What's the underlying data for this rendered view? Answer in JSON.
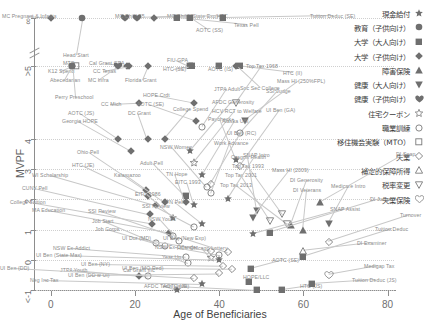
{
  "chart_data": {
    "type": "scatter",
    "title": "",
    "xlabel": "Age of Beneficiaries",
    "ylabel": "MVPF",
    "xlim": [
      -4,
      82
    ],
    "ylim": [
      -1,
      8
    ],
    "xticks": [
      "0",
      "20",
      "40",
      "60",
      "80"
    ],
    "xtickvals": [
      0,
      20,
      40,
      60,
      80
    ],
    "yticks": [
      "∞",
      ">5",
      "4",
      "3",
      "2",
      "1",
      "0",
      "<-1"
    ],
    "ytickvals": [
      8,
      6.4,
      4,
      3,
      2,
      1,
      0,
      -1
    ],
    "grid": "horizontal-dotted",
    "legend_position": "top-right-outside",
    "axis_break": true,
    "series": [
      {
        "name": "現金給付",
        "marker": "star",
        "color": "#6a6a6a"
      },
      {
        "name": "教育（子供向け）",
        "marker": "circle-filled",
        "color": "#6a6a6a"
      },
      {
        "name": "大学（大人向け）",
        "marker": "square-filled",
        "color": "#6a6a6a"
      },
      {
        "name": "大学（子供向け）",
        "marker": "diamond-filled",
        "color": "#6a6a6a"
      },
      {
        "name": "障害保険",
        "marker": "triangle-up-filled",
        "color": "#6a6a6a"
      },
      {
        "name": "健康（大人向け）",
        "marker": "triangle-down-filled",
        "color": "#6a6a6a"
      },
      {
        "name": "健康（子供向け）",
        "marker": "heart-filled",
        "color": "#6a6a6a"
      },
      {
        "name": "住宅クーポン",
        "marker": "star-open",
        "color": "#6a6a6a"
      },
      {
        "name": "職業訓練",
        "marker": "circle-open",
        "color": "#6a6a6a"
      },
      {
        "name": "移住機会実験（MTO）",
        "marker": "square-open",
        "color": "#6a6a6a"
      },
      {
        "name": "失業",
        "marker": "diamond-open",
        "color": "#6a6a6a"
      },
      {
        "name": "補定的保障所得",
        "marker": "triangle-up-open",
        "color": "#6a6a6a"
      },
      {
        "name": "税率変更",
        "marker": "triangle-down-open",
        "color": "#6a6a6a"
      },
      {
        "name": "失業保険",
        "marker": "heart-open",
        "color": "#6a6a6a"
      }
    ],
    "points": [
      {
        "label": "MC Pregnant & Infants",
        "x": 0.0,
        "y": 8.0,
        "marker": "diamond-filled",
        "lx": 2,
        "ly": 13
      },
      {
        "label": "Head Start",
        "x": 7.5,
        "y": 8.0,
        "marker": "circle-filled",
        "lx": 63,
        "ly": 52
      },
      {
        "label": "MC Child 85",
        "x": 17.5,
        "y": 8.0,
        "marker": "heart-filled",
        "lx": 115,
        "ly": 13
      },
      {
        "label": "MC Child (State Exp)",
        "x": 20.5,
        "y": 8.0,
        "marker": "heart-filled",
        "lx": 167,
        "ly": 13
      },
      {
        "label": "HTC",
        "x": 24.5,
        "y": 8.0,
        "marker": "diamond-filled",
        "lx": 217,
        "ly": 13
      },
      {
        "label": "Texas Pell",
        "x": 30.0,
        "y": 8.0,
        "marker": "square-filled",
        "lx": 234,
        "ly": 22
      },
      {
        "label": "AOTC (SS)",
        "x": 33.0,
        "y": 8.0,
        "marker": "square-filled",
        "lx": 196,
        "ly": 27
      },
      {
        "label": "Tuition Deduc (SE)",
        "x": 41.0,
        "y": 8.0,
        "marker": "square-filled",
        "lx": 310,
        "ly": 13
      },
      {
        "label": "MTO",
        "x": 6.0,
        "y": 6.4,
        "marker": "square-open",
        "lx": 63,
        "ly": 60
      },
      {
        "label": "K12 Spend",
        "x": 5.0,
        "y": 6.4,
        "marker": "circle-filled",
        "lx": 48,
        "ly": 68
      },
      {
        "label": "Abecedarian",
        "x": 5.0,
        "y": 6.4,
        "marker": "circle-filled",
        "lx": 50,
        "ly": 77
      },
      {
        "label": "Perry Preschool",
        "x": 5.0,
        "y": 6.4,
        "marker": "circle-filled",
        "lx": 55,
        "ly": 94
      },
      {
        "label": "Cal Grant GPA",
        "x": 18.0,
        "y": 6.4,
        "marker": "diamond-filled",
        "lx": 89,
        "ly": 60
      },
      {
        "label": "CC Texas",
        "x": 18.5,
        "y": 6.4,
        "marker": "diamond-filled",
        "lx": 93,
        "ly": 68
      },
      {
        "label": "MC Infra",
        "x": 16.0,
        "y": 6.4,
        "marker": "heart-filled",
        "lx": 88,
        "ly": 77
      },
      {
        "label": "Florida Grant",
        "x": 23.0,
        "y": 6.4,
        "marker": "diamond-filled",
        "lx": 125,
        "ly": 77
      },
      {
        "label": "FIU GPA",
        "x": 33.0,
        "y": 6.4,
        "marker": "square-filled",
        "lx": 167,
        "ly": 57
      },
      {
        "label": "HTC (SE)",
        "x": 33.5,
        "y": 6.4,
        "marker": "square-filled",
        "lx": 163,
        "ly": 66
      },
      {
        "label": "AOTC (IS)",
        "x": 40.0,
        "y": 6.4,
        "marker": "square-filled",
        "lx": 208,
        "ly": 66
      },
      {
        "label": "HTC (II)",
        "x": 45.0,
        "y": 6.4,
        "marker": "square-filled",
        "lx": 283,
        "ly": 70
      },
      {
        "label": "Soc Sec College",
        "x": 44.0,
        "y": 6.4,
        "marker": "diamond-filled",
        "lx": 240,
        "ly": 85
      },
      {
        "label": "CC Mich",
        "x": 21.0,
        "y": 5.2,
        "marker": "diamond-filled",
        "lx": 101,
        "ly": 101
      },
      {
        "label": "AOTC (JS)",
        "x": 16.0,
        "y": 4.0,
        "marker": "diamond-filled",
        "lx": 68,
        "ly": 110
      },
      {
        "label": "DC Grant",
        "x": 23.0,
        "y": 4.0,
        "marker": "diamond-filled",
        "lx": 128,
        "ly": 110
      },
      {
        "label": "HOPE Crdt",
        "x": 34.0,
        "y": 5.2,
        "marker": "diamond-filled",
        "lx": 143,
        "ly": 92
      },
      {
        "label": "AOTC (SE)",
        "x": 34.5,
        "y": 4.6,
        "marker": "diamond-filled",
        "lx": 137,
        "ly": 101
      },
      {
        "label": "College Spend",
        "x": 27.0,
        "y": 4.0,
        "marker": "diamond-filled",
        "lx": 173,
        "ly": 106
      },
      {
        "label": "Georgia HOPE",
        "x": 19.0,
        "y": 3.6,
        "marker": "diamond-filled",
        "lx": 62,
        "ly": 118
      },
      {
        "label": "Paycheck+",
        "x": 44.0,
        "y": 3.3,
        "marker": "star",
        "lx": 208,
        "ly": 116
      },
      {
        "label": "Ohio Pell",
        "x": 22.5,
        "y": 2.3,
        "marker": "diamond-filled",
        "lx": 77,
        "ly": 149
      },
      {
        "label": "HTC (JE)",
        "x": 23.0,
        "y": 2.1,
        "marker": "diamond-filled",
        "lx": 72,
        "ly": 162
      },
      {
        "label": "Adult Pell",
        "x": 32.0,
        "y": 2.1,
        "marker": "square-filled",
        "lx": 140,
        "ly": 160
      },
      {
        "label": "NSW Women",
        "x": 37.0,
        "y": 2.4,
        "marker": "circle-open",
        "lx": 160,
        "ly": 144
      },
      {
        "label": "Kalamazoo",
        "x": 27.0,
        "y": 1.9,
        "marker": "diamond-filled",
        "lx": 114,
        "ly": 172
      },
      {
        "label": "WI Scholarship",
        "x": 25.0,
        "y": 1.8,
        "marker": "diamond-filled",
        "lx": 32,
        "ly": 172
      },
      {
        "label": "TN Hope",
        "x": 32.0,
        "y": 1.9,
        "marker": "diamond-filled",
        "lx": 166,
        "ly": 171
      },
      {
        "label": "EITC 1993",
        "x": 34.0,
        "y": 1.8,
        "marker": "star",
        "lx": 175,
        "ly": 179
      },
      {
        "label": "CUNY Pell",
        "x": 23.5,
        "y": 1.5,
        "marker": "diamond-filled",
        "lx": 22,
        "ly": 185
      },
      {
        "label": "EITC 1986",
        "x": 29.0,
        "y": 1.4,
        "marker": "star",
        "lx": 135,
        "ly": 191
      },
      {
        "label": "College Tuition",
        "x": 24.0,
        "y": 1.2,
        "marker": "diamond-filled",
        "lx": 10,
        "ly": 199
      },
      {
        "label": "SSI Review",
        "x": 34.0,
        "y": 1.1,
        "marker": "circle-open",
        "lx": 142,
        "ly": 203
      },
      {
        "label": "TN Pell",
        "x": 36.0,
        "y": 1.2,
        "marker": "star",
        "lx": 166,
        "ly": 199
      },
      {
        "label": "MA Education",
        "x": 28.0,
        "y": 0.9,
        "marker": "diamond-filled",
        "lx": 32,
        "ly": 207
      },
      {
        "label": "SSI Review",
        "x": 29.0,
        "y": 0.8,
        "marker": "circle-open",
        "lx": 88,
        "ly": 208
      },
      {
        "label": "Oregon Health",
        "x": 49.0,
        "y": 1.6,
        "marker": "triangle-down-filled",
        "lx": 231,
        "ly": 154
      },
      {
        "label": "Top Tax 1993",
        "x": 55.0,
        "y": 1.5,
        "marker": "triangle-down-open",
        "lx": 232,
        "ly": 163
      },
      {
        "label": "Mass HI (2009)",
        "x": 48.0,
        "y": 1.4,
        "marker": "triangle-down-filled",
        "lx": 272,
        "ly": 167
      },
      {
        "label": "Top Tax 2001",
        "x": 52.0,
        "y": 1.3,
        "marker": "triangle-down-open",
        "lx": 225,
        "ly": 172
      },
      {
        "label": "Top Tax 2013",
        "x": 56.0,
        "y": 1.2,
        "marker": "triangle-down-open",
        "lx": 220,
        "ly": 182
      },
      {
        "label": "DI Generosity",
        "x": 57.0,
        "y": 1.15,
        "marker": "triangle-up-filled",
        "lx": 290,
        "ly": 177
      },
      {
        "label": "DI Veterans",
        "x": 60.0,
        "y": 1.0,
        "marker": "triangle-up-filled",
        "lx": 293,
        "ly": 187
      },
      {
        "label": "Medicare Intro",
        "x": 66.0,
        "y": 1.2,
        "marker": "triangle-down-filled",
        "lx": 331,
        "ly": 183
      },
      {
        "label": "Top Tax 1968",
        "x": 44.0,
        "y": 5.2,
        "marker": "triangle-down-open",
        "lx": 246,
        "ly": 63
      },
      {
        "label": "JTPA Adult",
        "x": 36.0,
        "y": 4.4,
        "marker": "circle-open",
        "lx": 214,
        "ly": 86
      },
      {
        "label": "SSI Judge",
        "x": 45.0,
        "y": 4.2,
        "marker": "circle-open",
        "lx": 266,
        "ly": 88
      },
      {
        "label": "Mass HI (250%FPL)",
        "x": 46.0,
        "y": 4.6,
        "marker": "triangle-down-filled",
        "lx": 277,
        "ly": 78
      },
      {
        "label": "AFDC Generosity",
        "x": 33.0,
        "y": 3.6,
        "marker": "star",
        "lx": 212,
        "ly": 99
      },
      {
        "label": "HCV RCT to Welfare",
        "x": 34.0,
        "y": 3.2,
        "marker": "star-open",
        "lx": 212,
        "ly": 108
      },
      {
        "label": "UI Ben (GA)",
        "x": 45.0,
        "y": 3.1,
        "marker": "diamond-open",
        "lx": 266,
        "ly": 107
      },
      {
        "label": "Alaska UBI",
        "x": 36.0,
        "y": 2.8,
        "marker": "star",
        "lx": 222,
        "ly": 118
      },
      {
        "label": "UI Ben (RC)",
        "x": 38.0,
        "y": 2.5,
        "marker": "diamond-open",
        "lx": 227,
        "ly": 130
      },
      {
        "label": "Work Advance",
        "x": 38.0,
        "y": 2.2,
        "marker": "circle-open",
        "lx": 214,
        "ly": 140
      },
      {
        "label": "SNAP Intro",
        "x": 42.0,
        "y": 2.0,
        "marker": "star",
        "lx": 243,
        "ly": 152
      },
      {
        "label": "Job Start",
        "x": 25.0,
        "y": 0.55,
        "marker": "circle-open",
        "lx": 92,
        "ly": 218
      },
      {
        "label": "NSW Youth",
        "x": 30.5,
        "y": 0.62,
        "marker": "circle-open",
        "lx": 148,
        "ly": 216
      },
      {
        "label": "Job Corps",
        "x": 27.0,
        "y": 0.45,
        "marker": "circle-open",
        "lx": 95,
        "ly": 226
      },
      {
        "label": "NSW Ex-Addict",
        "x": 32.0,
        "y": 0.1,
        "marker": "circle-open",
        "lx": 53,
        "ly": 245
      },
      {
        "label": "Year Up",
        "x": 32.5,
        "y": -0.1,
        "marker": "circle-open",
        "lx": 162,
        "ly": 254
      },
      {
        "label": "HCV Chicago Lottery",
        "x": 38.0,
        "y": 0.05,
        "marker": "star-open",
        "lx": 177,
        "ly": 245
      },
      {
        "label": "JTPA Youth",
        "x": 23.0,
        "y": -0.55,
        "marker": "circle-open",
        "lx": 60,
        "ly": 267
      },
      {
        "label": "Cal Grant Inc",
        "x": 21.0,
        "y": -0.55,
        "marker": "diamond-filled",
        "lx": 123,
        "ly": 267
      },
      {
        "label": "AFDC Term Limits",
        "x": 30.0,
        "y": -1.0,
        "marker": "star",
        "lx": 144,
        "ly": 283
      },
      {
        "label": "UI Dur (MD)",
        "x": 38.0,
        "y": 0.3,
        "marker": "diamond-open",
        "lx": 122,
        "ly": 235
      },
      {
        "label": "UI Ben (New Exp)",
        "x": 42.0,
        "y": 0.25,
        "marker": "diamond-open",
        "lx": 163,
        "ly": 235
      },
      {
        "label": "NSW Ex-Offender",
        "x": 40.0,
        "y": 0.15,
        "marker": "circle-open",
        "lx": 155,
        "ly": 244
      },
      {
        "label": "UI Ben (State Max)",
        "x": 40.0,
        "y": 0.0,
        "marker": "star",
        "lx": 36,
        "ly": 252
      },
      {
        "label": "UI Ben (NY)",
        "x": 41.0,
        "y": -0.2,
        "marker": "diamond-open",
        "lx": 81,
        "ly": 261
      },
      {
        "label": "UI Ben (MO Red)",
        "x": 43.0,
        "y": -0.3,
        "marker": "diamond-open",
        "lx": 122,
        "ly": 265
      },
      {
        "label": "UI Ben (DD w UI)",
        "x": 40.0,
        "y": -0.45,
        "marker": "diamond-open",
        "lx": 68,
        "ly": 272
      },
      {
        "label": "UI Ben (DD)",
        "x": 34.0,
        "y": -0.6,
        "marker": "diamond-open",
        "lx": 0,
        "ly": 265
      },
      {
        "label": "Neg Inc Tax",
        "x": 36.0,
        "y": -0.8,
        "marker": "star",
        "lx": 30,
        "ly": 277
      },
      {
        "label": "AOTC (JE)",
        "x": 49.0,
        "y": -1.0,
        "marker": "square-filled",
        "lx": 163,
        "ly": 283
      },
      {
        "label": "HTC (JS)",
        "x": 55.0,
        "y": -1.0,
        "marker": "square-filled",
        "lx": 300,
        "ly": 283
      },
      {
        "label": "HOPE/LLC",
        "x": 47.0,
        "y": -0.75,
        "marker": "square-filled",
        "lx": 243,
        "ly": 274
      },
      {
        "label": "AOTC (SE)",
        "x": 47.5,
        "y": -0.3,
        "marker": "square-filled",
        "lx": 272,
        "ly": 257
      },
      {
        "label": "DI Judge",
        "x": 52.0,
        "y": 0.9,
        "marker": "square-filled",
        "lx": 370,
        "ly": 196
      },
      {
        "label": "DI Examiner",
        "x": 60.0,
        "y": 0.3,
        "marker": "triangle-up-open",
        "lx": 357,
        "ly": 240
      },
      {
        "label": "Tuition Deduc (JS)",
        "x": 62.0,
        "y": -0.8,
        "marker": "square-filled",
        "lx": 352,
        "ly": 277
      },
      {
        "label": "Tuition Deduc",
        "x": 60.0,
        "y": 0.1,
        "marker": "square-filled",
        "lx": 375,
        "ly": 226
      },
      {
        "label": "Medigap Tax",
        "x": 66.0,
        "y": -0.5,
        "marker": "heart-open",
        "lx": 364,
        "ly": 263
      },
      {
        "label": "Turnover",
        "x": 66.0,
        "y": 0.6,
        "marker": "diamond-open",
        "lx": 400,
        "ly": 212
      },
      {
        "label": "DI Snap",
        "x": 64.0,
        "y": 1.9,
        "marker": "triangle-up-filled",
        "lx": 396,
        "ly": 151
      },
      {
        "label": "SNAP Assist",
        "x": 48.0,
        "y": 0.85,
        "marker": "star",
        "lx": 330,
        "ly": 206
      }
    ]
  }
}
